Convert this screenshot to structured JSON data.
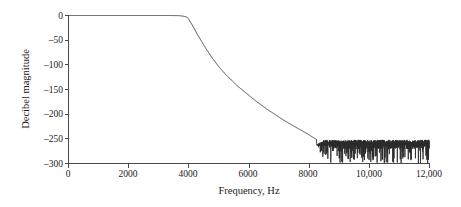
{
  "chart_data": {
    "type": "line",
    "title": "",
    "subtitle": "",
    "xlabel": "Frequency, Hz",
    "ylabel": "Decibel magnitude",
    "xlim": [
      0,
      12000
    ],
    "ylim": [
      -300,
      0
    ],
    "grid": false,
    "legend": null,
    "xticks": [
      0,
      2000,
      4000,
      6000,
      8000,
      10000,
      12000
    ],
    "xtick_labels": [
      "0",
      "2000",
      "4000",
      "6000",
      "8000",
      "10,000",
      "12,000"
    ],
    "yticks": [
      0,
      -50,
      -100,
      -150,
      -200,
      -250,
      -300
    ],
    "ytick_labels": [
      "0",
      "–50",
      "–100",
      "–150",
      "–200",
      "–250",
      "–300"
    ],
    "line_color": "#2b2b2b",
    "axis_color": "#4a4a4a",
    "series": [
      {
        "name": "Filter magnitude response",
        "x": [
          0,
          200,
          400,
          600,
          800,
          1000,
          1200,
          1400,
          1600,
          1800,
          2000,
          2200,
          2400,
          2600,
          2800,
          3000,
          3200,
          3400,
          3600,
          3700,
          3800,
          3900,
          3950,
          4000,
          4100,
          4200,
          4300,
          4400,
          4500,
          4600,
          4700,
          4800,
          4900,
          5000,
          5200,
          5400,
          5600,
          5800,
          6000,
          6200,
          6400,
          6600,
          6800,
          7000,
          7200,
          7400,
          7600,
          7800,
          8000,
          8100,
          8200,
          8300,
          8400,
          8500,
          8600,
          8800,
          9000,
          9200,
          9400,
          9600,
          9800,
          10000,
          10200,
          10400,
          10600,
          10800,
          11000,
          11200,
          11400,
          11600,
          11800,
          12000
        ],
        "y": [
          0,
          0,
          0,
          0,
          0,
          0,
          0,
          0,
          0,
          0,
          0,
          0,
          0,
          0,
          0,
          0,
          0,
          0,
          -0.2,
          -0.5,
          -1.2,
          -2.5,
          -4,
          -8,
          -18,
          -29,
          -40,
          -50,
          -60,
          -70,
          -79,
          -88,
          -96,
          -104,
          -118,
          -130,
          -142,
          -152,
          -162,
          -172,
          -181,
          -190,
          -198,
          -206,
          -214,
          -221,
          -228,
          -235,
          -242,
          -246,
          -250,
          -253,
          -255,
          -256,
          -257,
          -258,
          -258,
          -258,
          -259,
          -259,
          -259,
          -259,
          -260,
          -260,
          -260,
          -260,
          -260,
          -260,
          -261,
          -261,
          -261,
          -262
        ],
        "description": "Lowpass filter magnitude response: flat 0 dB passband to about 4000 Hz, linear roll-off through the transition band, then a stopband noise floor near -255 to -300 dB beyond about 8200 Hz"
      }
    ],
    "noise_floor": {
      "start_hz": 8250,
      "end_hz": 12000,
      "mean_db": -262,
      "peak_db": -252,
      "min_db": -300,
      "description": "Dense numerical-precision ripple with deep downward spikes reaching the -300 dB axis"
    },
    "annotations": []
  },
  "figure": {
    "width": 461,
    "height": 207,
    "background": "#ffffff"
  }
}
